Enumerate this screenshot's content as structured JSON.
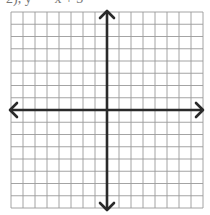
{
  "header": {
    "clipped_text": "2), y = −x + 3"
  },
  "diagram": {
    "type": "coordinate-grid",
    "columns": 16,
    "rows": 16,
    "grid": {
      "left": 11,
      "top": 12,
      "right": 203,
      "bottom": 208
    },
    "origin": {
      "x": 107,
      "y": 110
    },
    "colors": {
      "grid_line": "#9a9a9a",
      "axis": "#2a2a2a",
      "background": "#ffffff"
    },
    "axes": {
      "x_axis": {
        "arrows": [
          "left",
          "right"
        ]
      },
      "y_axis": {
        "arrows": [
          "up",
          "down"
        ]
      }
    }
  }
}
